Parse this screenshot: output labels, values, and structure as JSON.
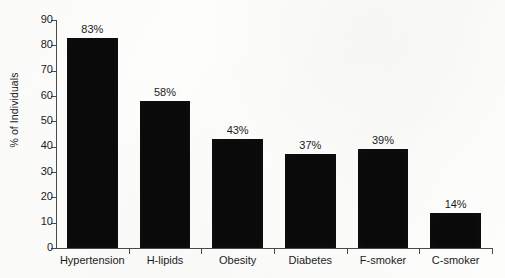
{
  "chart_data": {
    "type": "bar",
    "title": "",
    "subtitle": "",
    "xlabel": "",
    "ylabel": "% of Individuals",
    "categories": [
      "Hypertension",
      "H-lipids",
      "Obesity",
      "Diabetes",
      "F-smoker",
      "C-smoker"
    ],
    "values": [
      83,
      58,
      43,
      37,
      39,
      14
    ],
    "value_labels": [
      "83%",
      "58%",
      "43%",
      "37%",
      "39%",
      "14%"
    ],
    "ylim": [
      0,
      90
    ],
    "ytick_step": 10,
    "ytick_labels": [
      "0",
      "10",
      "20",
      "30",
      "40",
      "50",
      "60",
      "70",
      "80",
      "90"
    ],
    "grid": false,
    "legend": false,
    "legend_position": "none",
    "series": [
      {
        "name": "% of Individuals",
        "values": [
          83,
          58,
          43,
          37,
          39,
          14
        ],
        "color": "#0a0a0a"
      }
    ],
    "colors": {
      "bar": "#0a0a0a",
      "axis": "#4a4a4a",
      "text": "#1b1b1b",
      "background": "#fdfdfc"
    }
  }
}
